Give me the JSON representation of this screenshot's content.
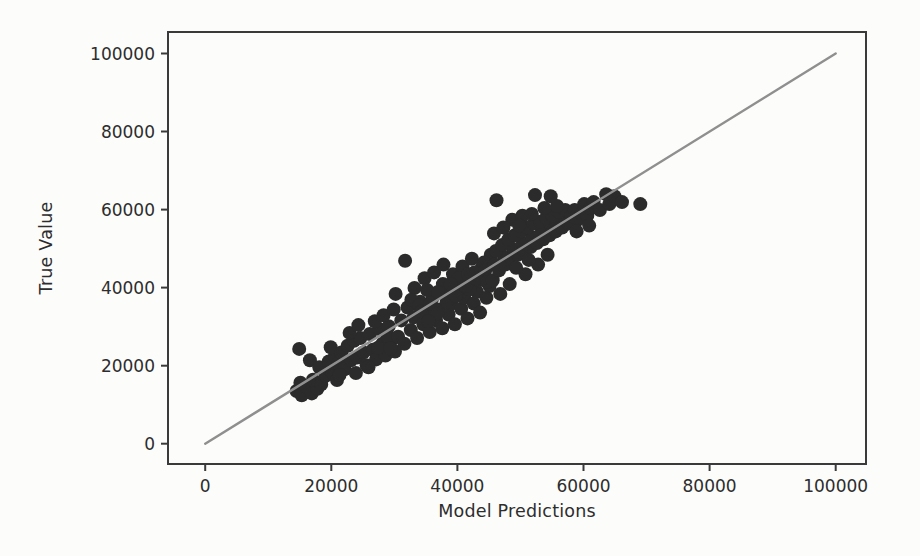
{
  "figure": {
    "background": "#fcfcfa"
  },
  "chart_data": {
    "type": "scatter",
    "title": "",
    "xlabel": "Model Predictions",
    "ylabel": "True Value",
    "xlim": [
      -5900,
      104800
    ],
    "ylim": [
      -5200,
      105500
    ],
    "x_ticks": [
      0,
      20000,
      40000,
      60000,
      80000,
      100000
    ],
    "y_ticks": [
      0,
      20000,
      40000,
      60000,
      80000,
      100000
    ],
    "grid": false,
    "legend": "none",
    "axis_color": "#3a3a3a",
    "tick_label_color": "#2d2d2d",
    "point_color": "#2b2b2b",
    "point_radius_px": 7,
    "reference_line": {
      "from": [
        0,
        0
      ],
      "to": [
        100000,
        100000
      ],
      "color": "#8f8f8f"
    },
    "points": [
      [
        14500,
        13500
      ],
      [
        15300,
        12400
      ],
      [
        16200,
        14300
      ],
      [
        16900,
        12900
      ],
      [
        17800,
        14100
      ],
      [
        15100,
        15600
      ],
      [
        17100,
        16400
      ],
      [
        18400,
        15200
      ],
      [
        19100,
        17400
      ],
      [
        14900,
        24300
      ],
      [
        16600,
        21400
      ],
      [
        18100,
        19600
      ],
      [
        19600,
        21100
      ],
      [
        20100,
        18400
      ],
      [
        20600,
        22400
      ],
      [
        19900,
        24700
      ],
      [
        20900,
        16300
      ],
      [
        21400,
        19900
      ],
      [
        21100,
        20600
      ],
      [
        21600,
        23400
      ],
      [
        22100,
        19100
      ],
      [
        22600,
        25100
      ],
      [
        23100,
        21400
      ],
      [
        23600,
        26400
      ],
      [
        24100,
        22100
      ],
      [
        24600,
        27100
      ],
      [
        25100,
        23400
      ],
      [
        25600,
        20100
      ],
      [
        26100,
        28100
      ],
      [
        26600,
        24100
      ],
      [
        27100,
        21600
      ],
      [
        27600,
        29400
      ],
      [
        28100,
        25600
      ],
      [
        28600,
        22600
      ],
      [
        29100,
        30100
      ],
      [
        29600,
        26600
      ],
      [
        30100,
        23600
      ],
      [
        22900,
        28400
      ],
      [
        24300,
        30400
      ],
      [
        26900,
        31400
      ],
      [
        28300,
        32900
      ],
      [
        29900,
        34400
      ],
      [
        21300,
        17600
      ],
      [
        23900,
        18100
      ],
      [
        25900,
        19600
      ],
      [
        27400,
        24600
      ],
      [
        28900,
        27600
      ],
      [
        29400,
        24400
      ],
      [
        30600,
        27400
      ],
      [
        31100,
        31600
      ],
      [
        31600,
        25600
      ],
      [
        32100,
        34900
      ],
      [
        32600,
        29100
      ],
      [
        33100,
        32400
      ],
      [
        33600,
        27100
      ],
      [
        34100,
        36400
      ],
      [
        34600,
        30600
      ],
      [
        35100,
        33400
      ],
      [
        35600,
        28600
      ],
      [
        36100,
        37400
      ],
      [
        36600,
        31600
      ],
      [
        37100,
        34400
      ],
      [
        37600,
        29600
      ],
      [
        38100,
        38900
      ],
      [
        38600,
        33100
      ],
      [
        39100,
        35900
      ],
      [
        39600,
        30600
      ],
      [
        40100,
        40400
      ],
      [
        40600,
        34600
      ],
      [
        41100,
        37400
      ],
      [
        41600,
        32100
      ],
      [
        42100,
        41400
      ],
      [
        42600,
        35900
      ],
      [
        43100,
        38900
      ],
      [
        43600,
        33600
      ],
      [
        44100,
        42900
      ],
      [
        44600,
        37400
      ],
      [
        45100,
        40400
      ],
      [
        31700,
        46900
      ],
      [
        33200,
        39900
      ],
      [
        34800,
        42400
      ],
      [
        36300,
        43900
      ],
      [
        37800,
        45900
      ],
      [
        39300,
        43400
      ],
      [
        40800,
        45400
      ],
      [
        42300,
        47400
      ],
      [
        43800,
        44900
      ],
      [
        45300,
        48400
      ],
      [
        30200,
        38400
      ],
      [
        32700,
        36900
      ],
      [
        35200,
        39400
      ],
      [
        37700,
        40900
      ],
      [
        40200,
        42400
      ],
      [
        42700,
        43900
      ],
      [
        44200,
        46400
      ],
      [
        33900,
        35400
      ],
      [
        36900,
        38900
      ],
      [
        39900,
        38100
      ],
      [
        41900,
        39600
      ],
      [
        43400,
        41900
      ],
      [
        34300,
        33900
      ],
      [
        35700,
        35900
      ],
      [
        36800,
        33400
      ],
      [
        38300,
        36400
      ],
      [
        39700,
        37900
      ],
      [
        41300,
        40400
      ],
      [
        42900,
        42400
      ],
      [
        44400,
        44400
      ],
      [
        45900,
        45900
      ],
      [
        47400,
        47900
      ],
      [
        48900,
        49900
      ],
      [
        50400,
        51400
      ],
      [
        51900,
        52900
      ],
      [
        53400,
        54400
      ],
      [
        54900,
        55900
      ],
      [
        56400,
        57400
      ],
      [
        35400,
        31400
      ],
      [
        38900,
        40900
      ],
      [
        41700,
        43400
      ],
      [
        44700,
        41400
      ],
      [
        45600,
        41900
      ],
      [
        46100,
        49400
      ],
      [
        46600,
        44400
      ],
      [
        47100,
        50900
      ],
      [
        47600,
        45900
      ],
      [
        48100,
        52400
      ],
      [
        48600,
        47400
      ],
      [
        49100,
        53400
      ],
      [
        49600,
        48400
      ],
      [
        50100,
        54400
      ],
      [
        50600,
        49400
      ],
      [
        51100,
        55400
      ],
      [
        51600,
        50400
      ],
      [
        52100,
        56400
      ],
      [
        52600,
        51400
      ],
      [
        53100,
        56900
      ],
      [
        53600,
        52400
      ],
      [
        54100,
        57900
      ],
      [
        54600,
        53400
      ],
      [
        55100,
        58400
      ],
      [
        55600,
        54400
      ],
      [
        56100,
        59400
      ],
      [
        56600,
        55400
      ],
      [
        57100,
        59900
      ],
      [
        46200,
        62400
      ],
      [
        52300,
        63700
      ],
      [
        54800,
        63400
      ],
      [
        48700,
        57400
      ],
      [
        50300,
        58400
      ],
      [
        45800,
        53900
      ],
      [
        47300,
        55400
      ],
      [
        49800,
        55900
      ],
      [
        51800,
        58900
      ],
      [
        53800,
        60400
      ],
      [
        55800,
        60900
      ],
      [
        46800,
        38400
      ],
      [
        48300,
        40900
      ],
      [
        50800,
        43400
      ],
      [
        52800,
        45900
      ],
      [
        54300,
        48400
      ],
      [
        49300,
        45100
      ],
      [
        51300,
        47100
      ],
      [
        57600,
        56400
      ],
      [
        58100,
        58400
      ],
      [
        58600,
        59900
      ],
      [
        59100,
        57400
      ],
      [
        59600,
        58900
      ],
      [
        60100,
        61400
      ],
      [
        60600,
        58400
      ],
      [
        61100,
        60400
      ],
      [
        61600,
        61900
      ],
      [
        62600,
        59900
      ],
      [
        63600,
        63900
      ],
      [
        64100,
        61400
      ],
      [
        64900,
        63400
      ],
      [
        66100,
        61900
      ],
      [
        69000,
        61400
      ],
      [
        58900,
        54400
      ],
      [
        60900,
        55900
      ]
    ]
  }
}
